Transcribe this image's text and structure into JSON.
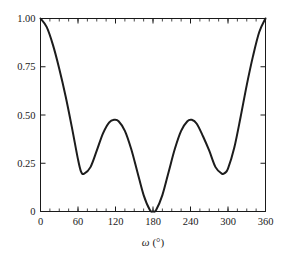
{
  "chart_data": {
    "type": "line",
    "title": "",
    "subtitle": "",
    "xlabel": "ω (°)",
    "ylabel": "",
    "xlim": [
      0,
      360
    ],
    "ylim": [
      0,
      1.0
    ],
    "grid": false,
    "legend": null,
    "x_ticks": [
      0,
      60,
      120,
      180,
      240,
      300,
      360
    ],
    "x_tick_labels": [
      "0",
      "60",
      "120",
      "180",
      "240",
      "300",
      "360"
    ],
    "x_minor_tick_step": 15,
    "y_ticks": [
      0,
      0.25,
      0.5,
      0.75,
      1.0
    ],
    "y_tick_labels": [
      "0",
      "0.25",
      "0.50",
      "0.75",
      "1.00"
    ],
    "series": [
      {
        "name": "curve",
        "color": "#1c1c1c",
        "x": [
          0,
          10,
          20,
          30,
          40,
          50,
          60,
          65,
          70,
          80,
          90,
          100,
          110,
          118,
          125,
          135,
          145,
          155,
          165,
          175,
          180,
          185,
          195,
          205,
          215,
          225,
          235,
          242,
          250,
          260,
          270,
          280,
          290,
          295,
          300,
          310,
          320,
          330,
          340,
          350,
          360
        ],
        "y": [
          1.0,
          0.955,
          0.862,
          0.74,
          0.6,
          0.44,
          0.27,
          0.205,
          0.196,
          0.23,
          0.315,
          0.405,
          0.462,
          0.475,
          0.468,
          0.418,
          0.325,
          0.205,
          0.085,
          0.008,
          0.0,
          0.008,
          0.085,
          0.205,
          0.325,
          0.418,
          0.468,
          0.475,
          0.455,
          0.39,
          0.315,
          0.23,
          0.196,
          0.2,
          0.222,
          0.33,
          0.487,
          0.655,
          0.805,
          0.93,
          1.0
        ]
      }
    ],
    "annotations": []
  },
  "axes": {
    "frame_color": "#1a1a1a",
    "background": "#ffffff"
  }
}
